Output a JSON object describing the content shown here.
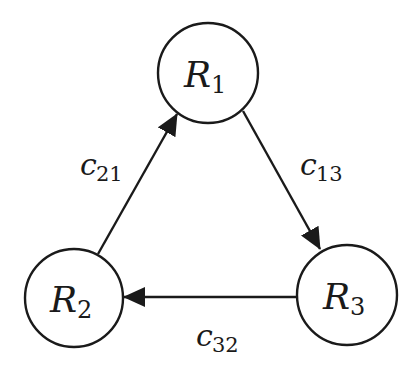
{
  "diagram": {
    "type": "directed-graph",
    "colors": {
      "background": "#ffffff",
      "stroke": "#1a1a1a",
      "text": "#1a1a1a"
    },
    "nodes": [
      {
        "id": "R1",
        "symbol": "R",
        "subscript": "1",
        "cx": 208,
        "cy": 73,
        "r": 50
      },
      {
        "id": "R2",
        "symbol": "R",
        "subscript": "2",
        "cx": 74,
        "cy": 298,
        "r": 49
      },
      {
        "id": "R3",
        "symbol": "R",
        "subscript": "3",
        "cx": 347,
        "cy": 295,
        "r": 50
      }
    ],
    "edges": [
      {
        "id": "c21",
        "from": "R2",
        "to": "R1",
        "symbol": "c",
        "subscript": "21"
      },
      {
        "id": "c13",
        "from": "R1",
        "to": "R3",
        "symbol": "c",
        "subscript": "13"
      },
      {
        "id": "c32",
        "from": "R3",
        "to": "R2",
        "symbol": "c",
        "subscript": "32"
      }
    ]
  }
}
